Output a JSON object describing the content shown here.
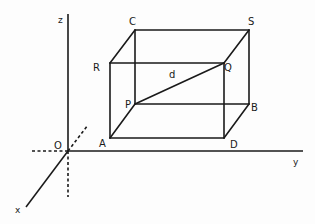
{
  "diagram": {
    "axes": {
      "origin_label": "O",
      "x_label": "x",
      "y_label": "y",
      "z_label": "z"
    },
    "vertices": {
      "A": "A",
      "B": "B",
      "C": "C",
      "D": "D",
      "P": "P",
      "Q": "Q",
      "R": "R",
      "S": "S"
    },
    "diagonal_label": "d",
    "colors": {
      "line": "#1a1a1a",
      "background": "#fdfdfd"
    }
  }
}
